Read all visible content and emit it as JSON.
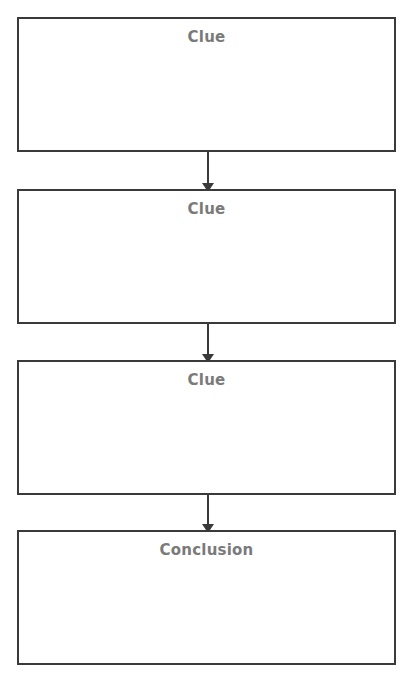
{
  "diagram": {
    "type": "flowchart",
    "direction": "top-to-bottom",
    "nodes": [
      {
        "id": "clue1",
        "label": "Clue"
      },
      {
        "id": "clue2",
        "label": "Clue"
      },
      {
        "id": "clue3",
        "label": "Clue"
      },
      {
        "id": "conclusion",
        "label": "Conclusion"
      }
    ],
    "edges": [
      {
        "from": "clue1",
        "to": "clue2"
      },
      {
        "from": "clue2",
        "to": "clue3"
      },
      {
        "from": "clue3",
        "to": "conclusion"
      }
    ],
    "colors": {
      "border": "#3a3a3a",
      "label": "#7a7a7a",
      "background": "#ffffff"
    }
  }
}
